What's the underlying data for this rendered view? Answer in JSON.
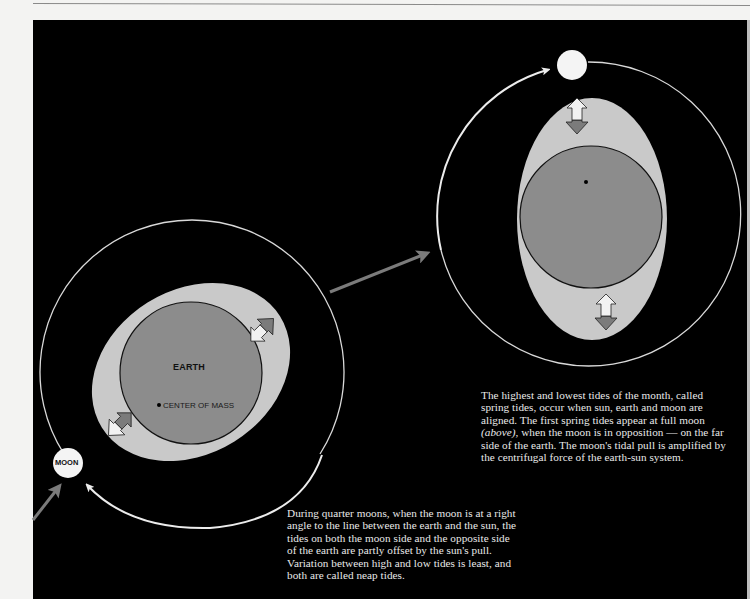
{
  "diagram": {
    "colors": {
      "background": "#000000",
      "page": "#f3f3f2",
      "earth": "#8c8c8c",
      "tidal_bulge": "#c9c9c9",
      "orbit_line": "#d8d8d8",
      "moon": "#f4f4f4",
      "gray_arrow": "#7b7b7b",
      "white_arrow": "#f2f2f2"
    },
    "quarter_moon_panel": {
      "earth_label": "EARTH",
      "center_of_mass_label": "CENTER OF MASS",
      "moon_label": "MOON",
      "icons": [
        "orbit-circle",
        "tidal-bulge-ellipse",
        "earth-circle",
        "double-arrow-icon",
        "double-arrow-icon",
        "moon-circle",
        "curved-orbit-arrow",
        "gray-direction-arrow"
      ]
    },
    "full_moon_panel": {
      "icons": [
        "orbit-circle",
        "tidal-bulge-ellipse",
        "earth-circle",
        "center-of-mass-dot",
        "double-arrow-icon",
        "double-arrow-icon",
        "moon-circle",
        "curved-orbit-arrow"
      ]
    },
    "transition_arrow": "gray-direction-arrow",
    "captions": {
      "spring_tides_before": "The highest and lowest tides of the month, called spring tides, occur when sun, earth and moon are aligned. The first spring tides appear at full moon ",
      "spring_tides_italic": "(above)",
      "spring_tides_after": ", when the moon is in opposition — on the far side of the earth. The moon's tidal pull is amplified by the centrifugal force of the earth-sun system.",
      "neap_tides": "During quarter moons, when the moon is at a right angle to the line between the earth and the sun, the tides on both the moon side and the opposite side of the earth are partly offset by the sun's pull. Variation between high and low tides is least, and both are called neap tides."
    }
  }
}
